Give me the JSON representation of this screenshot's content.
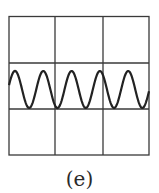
{
  "figure": {
    "caption": "(e)",
    "grid": {
      "rows": 3,
      "cols": 3,
      "line_color": "#3a3a3a"
    },
    "wave": {
      "shape": "sine",
      "cycles": 5,
      "color": "#222222",
      "peak_x": [
        15,
        43,
        72,
        100,
        128
      ],
      "trough_x": [
        30,
        57,
        86,
        114,
        143
      ]
    }
  }
}
